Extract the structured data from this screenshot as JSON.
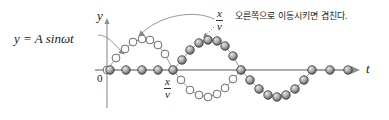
{
  "figure": {
    "background": "#ffffff",
    "axes": {
      "y_label": "y",
      "x_label": "t",
      "origin_label": "0",
      "axis_color": "#8a8a8a",
      "origin_x": 107,
      "origin_y": 70,
      "x_axis_end": 360,
      "y_axis_top": 18
    },
    "labels": {
      "equation": "y = A sinωt",
      "equation_parts": {
        "y": "y",
        "eq": "=",
        "A": "A",
        "sin": "sin",
        "omega": "ω",
        "t": "t"
      },
      "fraction_top": {
        "numerator": "x",
        "denominator": "v"
      },
      "fraction_axis": {
        "numerator": "x",
        "denominator": "v"
      },
      "annotation_korean": "오른쪽으로 이동시키면 겹친다.",
      "annotation_translation_note": "shift to the right and they overlap"
    },
    "colors": {
      "open_circle_fill": "#fdfdfd",
      "open_circle_stroke": "#6e6e6e",
      "filled_circle_light": "#d8d8d8",
      "filled_circle_dark": "#5d5d5d",
      "filled_circle_stroke": "#3c3c3c",
      "connector": "#9a9a9a",
      "axis": "#8f8f8f",
      "text": "#1a1a1a",
      "leader": "#8a8a8a"
    },
    "waves": [
      {
        "name": "open-wave",
        "style": "open",
        "description": "y = A sin wt, original wave drawn with open (white) circles",
        "points": [
          [
            107,
            70
          ],
          [
            116,
            58
          ],
          [
            125,
            49
          ],
          [
            133,
            42
          ],
          [
            142,
            39
          ],
          [
            150,
            40
          ],
          [
            158,
            45
          ],
          [
            165,
            54
          ],
          [
            173,
            70
          ],
          [
            181,
            80
          ],
          [
            190,
            90
          ],
          [
            199,
            95
          ],
          [
            208,
            97
          ],
          [
            217,
            94
          ],
          [
            225,
            88
          ],
          [
            233,
            79
          ],
          [
            241,
            70
          ]
        ]
      },
      {
        "name": "shifted-wave",
        "style": "filled",
        "description": "phase shifted wave drawn with shaded (gray) circles on and below axis",
        "points": [
          [
            110,
            70
          ],
          [
            126,
            70
          ],
          [
            142,
            70
          ],
          [
            158,
            70
          ],
          [
            173,
            70
          ],
          [
            182,
            60
          ],
          [
            190,
            50
          ],
          [
            199,
            43
          ],
          [
            208,
            40
          ],
          [
            217,
            41
          ],
          [
            225,
            46
          ],
          [
            233,
            56
          ],
          [
            241,
            70
          ],
          [
            250,
            80
          ],
          [
            259,
            89
          ],
          [
            268,
            95
          ],
          [
            277,
            97
          ],
          [
            286,
            95
          ],
          [
            295,
            89
          ],
          [
            304,
            80
          ],
          [
            312,
            70
          ],
          [
            330,
            70
          ],
          [
            348,
            70
          ]
        ]
      }
    ],
    "leaders": [
      {
        "name": "equation-leader",
        "from": [
          98,
          36
        ],
        "to": [
          122,
          52
        ]
      },
      {
        "name": "fraction-curve-leader",
        "from": [
          214,
          20
        ],
        "to": [
          140,
          39
        ]
      },
      {
        "name": "fraction-dotted-leader",
        "from": [
          214,
          26
        ],
        "to": [
          206,
          36
        ]
      }
    ]
  }
}
